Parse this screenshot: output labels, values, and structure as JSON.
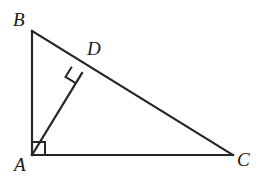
{
  "figure": {
    "kind": "right-triangle-with-altitude",
    "background_color": "#ffffff",
    "stroke_color": "#262626",
    "stroke_width": 2.2,
    "canvas": {
      "width": 263,
      "height": 179
    },
    "labels": {
      "B": "B",
      "D": "D",
      "A": "A",
      "C": "C"
    },
    "points": {
      "A": {
        "x": 32,
        "y": 155
      },
      "B": {
        "x": 32,
        "y": 31
      },
      "C": {
        "x": 233,
        "y": 155
      },
      "D": {
        "x": 82,
        "y": 73
      }
    },
    "segments": [
      {
        "name": "AB",
        "from": "A",
        "to": "B"
      },
      {
        "name": "BC",
        "from": "B",
        "to": "C"
      },
      {
        "name": "CA",
        "from": "C",
        "to": "A"
      },
      {
        "name": "AD",
        "from": "A",
        "to": "D"
      }
    ],
    "right_angles": [
      {
        "at": "A",
        "style": "square",
        "size": 13,
        "rotation_deg": 0
      },
      {
        "at": "D",
        "style": "square",
        "size": 12,
        "rotation_deg": 31
      }
    ]
  }
}
